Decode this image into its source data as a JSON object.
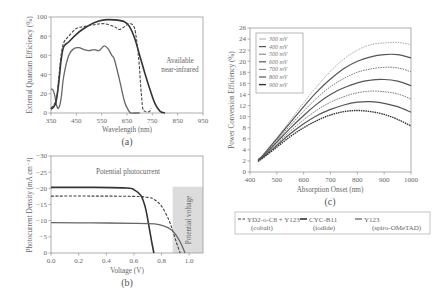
{
  "chart_data": [
    {
      "id": "a",
      "type": "line",
      "caption": "(a)",
      "xlabel": "Wavelength (nm)",
      "ylabel": "External Quantum Efficiency (%)",
      "xlim": [
        350,
        950
      ],
      "ylim": [
        0,
        100
      ],
      "xticks": [
        350,
        450,
        550,
        650,
        750,
        850,
        950
      ],
      "yticks": [
        0,
        20,
        40,
        60,
        80,
        100
      ],
      "annotation": "Available near-infrared",
      "series": [
        {
          "name": "YD2-o-C8 + Y123 (cobalt)",
          "style": "dashed",
          "x": [
            350,
            360,
            372,
            380,
            390,
            400,
            420,
            450,
            480,
            520,
            560,
            600,
            620,
            640,
            660,
            680,
            695,
            705,
            712,
            720,
            730,
            740,
            745
          ],
          "y": [
            5,
            8,
            15,
            35,
            60,
            73,
            80,
            88,
            90,
            92,
            93,
            90,
            87,
            90,
            93,
            88,
            60,
            25,
            5,
            2,
            1,
            2,
            5
          ]
        },
        {
          "name": "CYC-B11 (iodide)",
          "style": "solid-thick",
          "x": [
            350,
            360,
            370,
            380,
            390,
            400,
            420,
            450,
            480,
            520,
            560,
            600,
            640,
            660,
            680,
            700,
            720,
            740,
            760,
            780,
            800
          ],
          "y": [
            4,
            6,
            12,
            30,
            55,
            69,
            74,
            82,
            88,
            94,
            97,
            97,
            95,
            90,
            78,
            60,
            42,
            25,
            10,
            2,
            0
          ]
        },
        {
          "name": "Y123 (spiro-OMeTAD)",
          "style": "solid-gray",
          "x": [
            350,
            358,
            365,
            372,
            380,
            390,
            400,
            420,
            440,
            460,
            480,
            500,
            520,
            540,
            560,
            575,
            590,
            600,
            620,
            640,
            655,
            665,
            680,
            700
          ],
          "y": [
            25,
            24,
            18,
            8,
            5,
            15,
            38,
            60,
            67,
            68,
            66,
            65,
            66,
            65,
            70,
            67,
            60,
            56,
            35,
            12,
            3,
            0,
            0,
            0
          ]
        }
      ]
    },
    {
      "id": "b",
      "type": "line",
      "caption": "(b)",
      "xlabel": "Voltage (V)",
      "ylabel": "Photocurrent Density (mA cm⁻²)",
      "xlim": [
        0,
        1.1
      ],
      "ylim": [
        0,
        -30
      ],
      "xticks": [
        "0.0",
        "0.2",
        "0.4",
        "0.6",
        "0.8",
        "1.0"
      ],
      "yticks": [
        0,
        -5,
        -10,
        -15,
        -20,
        -25,
        -30
      ],
      "annotations": [
        "Potential photocurrent",
        "Potential voltage"
      ],
      "shaded_region": {
        "x": [
          0.88,
          1.1
        ],
        "y": [
          0,
          -20.5
        ]
      },
      "series": [
        {
          "name": "YD2-o-C8 + Y123 (cobalt)",
          "style": "dashed",
          "x": [
            0,
            0.3,
            0.6,
            0.7,
            0.75,
            0.8,
            0.85,
            0.88,
            0.91,
            0.935
          ],
          "y": [
            -17.6,
            -17.6,
            -17.5,
            -17.2,
            -16.5,
            -14.5,
            -10.5,
            -7,
            -3,
            0
          ]
        },
        {
          "name": "CYC-B11 (iodide)",
          "style": "solid-thick",
          "x": [
            0,
            0.3,
            0.55,
            0.6,
            0.65,
            0.68,
            0.7,
            0.72,
            0.735,
            0.745
          ],
          "y": [
            -20.3,
            -20.3,
            -20.1,
            -19.6,
            -17.8,
            -14.5,
            -10.5,
            -5.5,
            -2,
            0
          ]
        },
        {
          "name": "Y123 (spiro-OMeTAD)",
          "style": "solid-gray",
          "x": [
            0,
            0.3,
            0.6,
            0.75,
            0.82,
            0.87,
            0.9,
            0.93,
            0.95,
            0.97
          ],
          "y": [
            -9.4,
            -9.3,
            -9.2,
            -9.0,
            -8.3,
            -7.2,
            -5.8,
            -3.8,
            -2,
            0
          ]
        }
      ]
    },
    {
      "id": "c",
      "type": "line",
      "caption": "(c)",
      "xlabel": "Absorption Onset (nm)",
      "ylabel": "Power Conversion Efficiency (%)",
      "xlim": [
        400,
        1000
      ],
      "ylim": [
        0,
        26
      ],
      "xticks": [
        400,
        500,
        600,
        700,
        800,
        900,
        1000
      ],
      "yticks": [
        0,
        2,
        4,
        6,
        8,
        10,
        12,
        14,
        16,
        18,
        20,
        22,
        24,
        26
      ],
      "legend_position": "upper-left",
      "x": [
        430,
        450,
        500,
        550,
        600,
        650,
        700,
        750,
        800,
        850,
        900,
        950,
        1000
      ],
      "series": [
        {
          "name": "300 mV",
          "style": "dotted-light",
          "values": [
            2.3,
            3.2,
            6.2,
            9.3,
            12.5,
            15.5,
            18.2,
            20.4,
            22.0,
            23.0,
            23.3,
            23.4,
            23.0
          ]
        },
        {
          "name": "400 mV",
          "style": "solid",
          "values": [
            2.2,
            3.1,
            6.0,
            8.9,
            11.8,
            14.5,
            16.8,
            18.7,
            20.0,
            20.8,
            21.2,
            21.2,
            20.6
          ]
        },
        {
          "name": "500 mV",
          "style": "dotted",
          "values": [
            2.1,
            3.0,
            5.7,
            8.4,
            11.0,
            13.4,
            15.4,
            16.9,
            18.0,
            18.6,
            18.9,
            18.8,
            18.1
          ]
        },
        {
          "name": "600 mV",
          "style": "solid",
          "values": [
            2.1,
            2.9,
            5.4,
            7.9,
            10.2,
            12.3,
            14.0,
            15.2,
            16.1,
            16.6,
            16.7,
            16.4,
            15.6
          ]
        },
        {
          "name": "700 mV",
          "style": "dotted",
          "values": [
            2.0,
            2.8,
            5.1,
            7.4,
            9.4,
            11.2,
            12.6,
            13.6,
            14.3,
            14.6,
            14.5,
            14.1,
            13.2
          ]
        },
        {
          "name": "800 mV",
          "style": "solid",
          "values": [
            2.0,
            2.7,
            4.8,
            6.9,
            8.7,
            10.2,
            11.3,
            12.1,
            12.6,
            12.7,
            12.4,
            11.8,
            10.8
          ]
        },
        {
          "name": "900 mV",
          "style": "dotted-thick",
          "values": [
            1.9,
            2.6,
            4.5,
            6.4,
            8.0,
            9.3,
            10.3,
            10.9,
            11.1,
            10.9,
            10.4,
            9.5,
            8.3
          ]
        }
      ]
    }
  ],
  "shared_legend": {
    "items": [
      {
        "label_line1": "YD2-o-C8 + Y123",
        "label_line2": "(cobalt)",
        "style": "dashed"
      },
      {
        "label_line1": "CYC-B11",
        "label_line2": "(iodide)",
        "style": "solid-thick"
      },
      {
        "label_line1": "Y123",
        "label_line2": "(spiro-OMeTAD)",
        "style": "solid-gray"
      }
    ]
  }
}
